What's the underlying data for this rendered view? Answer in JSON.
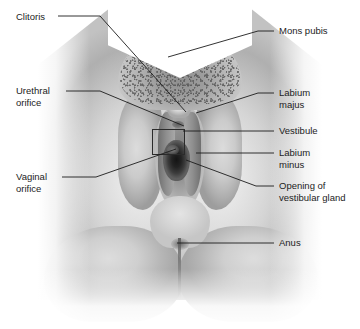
{
  "figure": {
    "width": 360,
    "height": 329,
    "image_kind": "grayscale-photograph",
    "line_color": "#1c1c1c",
    "text_color": "#1c1c1c",
    "background_color": "#ffffff"
  },
  "labels": {
    "clitoris": "Clitoris",
    "urethral_orifice": "Urethral\norifice",
    "vaginal_orifice": "Vaginal\norifice",
    "mons_pubis": "Mons pubis",
    "labium_majus": "Labium\nmajus",
    "vestibule": "Vestibule",
    "labium_minus": "Labium\nminus",
    "opening_of_vestibular_gland": "Opening of\nvestibular gland",
    "anus": "Anus"
  }
}
